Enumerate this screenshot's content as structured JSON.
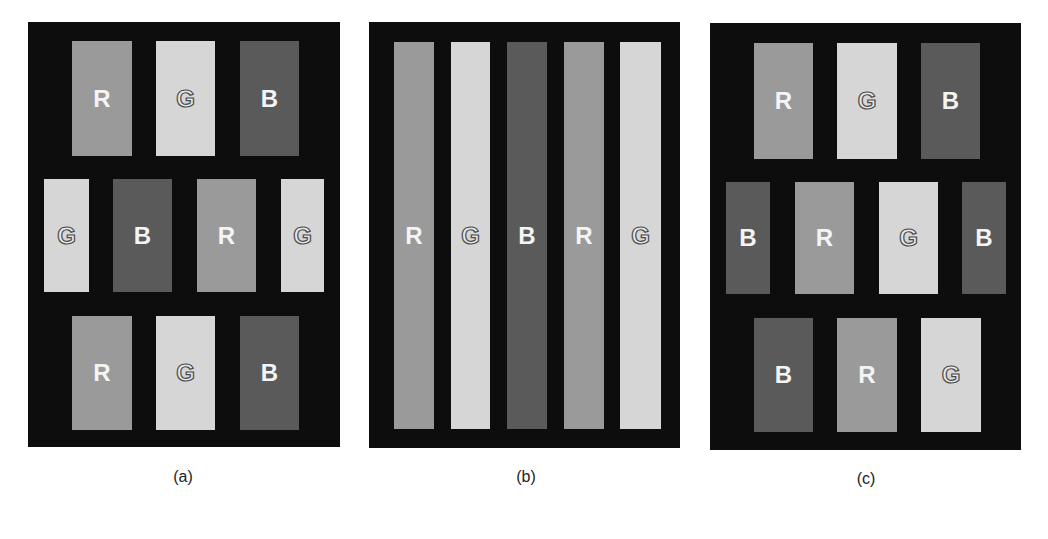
{
  "colors": {
    "background": "#ffffff",
    "panel_frame": "#0d0d0d",
    "R": "#9a9a9a",
    "G": "#d6d6d6",
    "B": "#5a5a5a"
  },
  "panels": [
    {
      "id": "a",
      "caption": "(a)",
      "frame": {
        "x": 28,
        "y": 22,
        "w": 312,
        "h": 425
      },
      "caption_pos": {
        "x": 153,
        "y": 468
      },
      "cells": [
        {
          "label": "R",
          "x": 72,
          "y": 41,
          "w": 60,
          "h": 115
        },
        {
          "label": "G",
          "x": 156,
          "y": 41,
          "w": 59,
          "h": 115
        },
        {
          "label": "B",
          "x": 240,
          "y": 41,
          "w": 59,
          "h": 115
        },
        {
          "label": "G",
          "x": 44,
          "y": 179,
          "w": 45,
          "h": 113
        },
        {
          "label": "B",
          "x": 113,
          "y": 179,
          "w": 59,
          "h": 113
        },
        {
          "label": "R",
          "x": 197,
          "y": 179,
          "w": 59,
          "h": 113
        },
        {
          "label": "G",
          "x": 281,
          "y": 179,
          "w": 43,
          "h": 113
        },
        {
          "label": "R",
          "x": 72,
          "y": 316,
          "w": 60,
          "h": 114
        },
        {
          "label": "G",
          "x": 156,
          "y": 316,
          "w": 59,
          "h": 114
        },
        {
          "label": "B",
          "x": 240,
          "y": 316,
          "w": 59,
          "h": 114
        }
      ]
    },
    {
      "id": "b",
      "caption": "(b)",
      "frame": {
        "x": 369,
        "y": 22,
        "w": 311,
        "h": 426
      },
      "caption_pos": {
        "x": 496,
        "y": 468
      },
      "cells": [
        {
          "label": "R",
          "x": 394,
          "y": 42,
          "w": 40,
          "h": 387
        },
        {
          "label": "G",
          "x": 451,
          "y": 42,
          "w": 39,
          "h": 387
        },
        {
          "label": "B",
          "x": 507,
          "y": 42,
          "w": 40,
          "h": 387
        },
        {
          "label": "R",
          "x": 564,
          "y": 42,
          "w": 40,
          "h": 387
        },
        {
          "label": "G",
          "x": 620,
          "y": 42,
          "w": 41,
          "h": 387
        }
      ]
    },
    {
      "id": "c",
      "caption": "(c)",
      "frame": {
        "x": 710,
        "y": 23,
        "w": 311,
        "h": 427
      },
      "caption_pos": {
        "x": 836,
        "y": 470
      },
      "cells": [
        {
          "label": "R",
          "x": 754,
          "y": 43,
          "w": 59,
          "h": 116
        },
        {
          "label": "G",
          "x": 837,
          "y": 43,
          "w": 60,
          "h": 116
        },
        {
          "label": "B",
          "x": 921,
          "y": 43,
          "w": 59,
          "h": 116
        },
        {
          "label": "B",
          "x": 726,
          "y": 182,
          "w": 44,
          "h": 112
        },
        {
          "label": "R",
          "x": 795,
          "y": 182,
          "w": 59,
          "h": 112
        },
        {
          "label": "G",
          "x": 879,
          "y": 182,
          "w": 59,
          "h": 112
        },
        {
          "label": "B",
          "x": 962,
          "y": 182,
          "w": 44,
          "h": 112
        },
        {
          "label": "B",
          "x": 754,
          "y": 318,
          "w": 59,
          "h": 114
        },
        {
          "label": "R",
          "x": 837,
          "y": 318,
          "w": 60,
          "h": 114
        },
        {
          "label": "G",
          "x": 921,
          "y": 318,
          "w": 60,
          "h": 114
        }
      ]
    }
  ]
}
